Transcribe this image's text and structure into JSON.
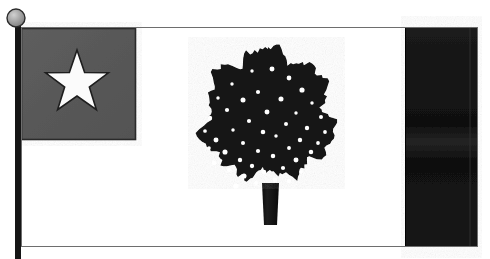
{
  "image": {
    "title": "Magnolia Flag illustration",
    "subject": "state flag on pole",
    "background_color": "#ffffff",
    "width": 490,
    "height": 259
  },
  "flagpole": {
    "name": "flagpole",
    "color": "#151515",
    "x": 15,
    "y": 22,
    "width": 6,
    "height": 237,
    "finial": {
      "name": "pole-finial-ball",
      "shape": "circle",
      "fill_color": "#9a9a9a",
      "edge_color": "#2b2b2b",
      "center_x": 16,
      "center_y": 18,
      "radius": 9
    }
  },
  "flag": {
    "name": "flag-body",
    "x": 21,
    "y": 27,
    "width": 457,
    "height": 220,
    "field_color": "#ffffff",
    "border_color": "#6e6e6e",
    "canton": {
      "name": "canton",
      "label": "blue canton (rendered dark gray)",
      "fill_color": "#5a5a5a",
      "edge_color": "#2a2a2a",
      "x": 21,
      "y": 28,
      "width": 115,
      "height": 112,
      "star": {
        "name": "white-star",
        "points": 5,
        "fill_color": "#fbfbfb",
        "edge_color": "#1e1e1e",
        "center_x": 77,
        "center_y": 83,
        "outer_radius": 33,
        "inner_radius": 13,
        "rotation_deg": -90
      }
    },
    "stripe": {
      "name": "fly-stripe",
      "label": "red vertical bar (rendered near-black)",
      "fill_color": "#141414",
      "edge_color": "#000000",
      "x": 405,
      "y": 27,
      "width": 73,
      "height": 220,
      "inner_divider_x": 470,
      "inner_divider_color": "#2e2e2e"
    },
    "emblem": {
      "name": "magnolia-tree",
      "label": "magnolia tree",
      "canopy_color": "#121212",
      "trunk_color": "#171717",
      "blossom_color": "#ffffff",
      "center_x": 268,
      "canopy_top_y": 50,
      "canopy_bottom_y": 192,
      "canopy_left_x": 205,
      "canopy_right_x": 331,
      "trunk": {
        "name": "tree-trunk",
        "x": 262,
        "y": 183,
        "top_width": 17,
        "bottom_width": 13,
        "bottom_y": 225
      },
      "blossom_count": 46,
      "blossoms": [
        [
          252,
          71
        ],
        [
          272,
          69
        ],
        [
          289,
          78
        ],
        [
          232,
          84
        ],
        [
          302,
          90
        ],
        [
          258,
          92
        ],
        [
          218,
          98
        ],
        [
          243,
          100
        ],
        [
          281,
          99
        ],
        [
          312,
          103
        ],
        [
          227,
          110
        ],
        [
          267,
          112
        ],
        [
          296,
          113
        ],
        [
          321,
          117
        ],
        [
          210,
          118
        ],
        [
          249,
          121
        ],
        [
          286,
          124
        ],
        [
          307,
          128
        ],
        [
          233,
          130
        ],
        [
          263,
          132
        ],
        [
          276,
          136
        ],
        [
          300,
          140
        ],
        [
          216,
          140
        ],
        [
          243,
          143
        ],
        [
          325,
          132
        ],
        [
          289,
          148
        ],
        [
          258,
          151
        ],
        [
          225,
          152
        ],
        [
          311,
          152
        ],
        [
          205,
          131
        ],
        [
          273,
          156
        ],
        [
          240,
          160
        ],
        [
          296,
          160
        ],
        [
          214,
          163
        ],
        [
          252,
          166
        ],
        [
          283,
          168
        ],
        [
          318,
          143
        ],
        [
          229,
          170
        ],
        [
          264,
          172
        ],
        [
          301,
          172
        ],
        [
          244,
          176
        ],
        [
          275,
          180
        ],
        [
          209,
          148
        ],
        [
          289,
          181
        ],
        [
          256,
          183
        ],
        [
          236,
          186
        ]
      ]
    }
  }
}
